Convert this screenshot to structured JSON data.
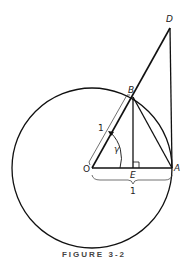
{
  "figure": {
    "caption": "FIGURE 3-2",
    "labels": {
      "O": "O",
      "A": "A",
      "B": "B",
      "D": "D",
      "E": "E",
      "gamma": "γ",
      "radius_OB": "1",
      "radius_OA": "1"
    },
    "points": {
      "O": [
        92,
        168
      ],
      "A": [
        172,
        168
      ],
      "B": [
        133,
        97
      ],
      "E": [
        133,
        168
      ],
      "D": [
        170,
        28
      ]
    },
    "circle": {
      "center": "O",
      "radius": 80
    }
  }
}
